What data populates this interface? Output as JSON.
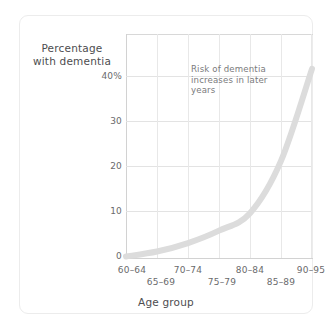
{
  "figure": {
    "background_color": "#ffffff",
    "card_border_color": "#ececec",
    "axis_color": "#d2d2d2",
    "grid_color": "#e5e5e5",
    "curve_color": "#dcdcdc",
    "text_color": "#58585a"
  },
  "chart_data": {
    "type": "line",
    "title": "",
    "xlabel": "Age group",
    "ylabel": "Percentage with dementia",
    "categories": [
      "60–64",
      "65–69",
      "70–74",
      "75–79",
      "80–84",
      "85–89",
      "90–95"
    ],
    "x": [
      0,
      1,
      2,
      3,
      4,
      5,
      6
    ],
    "values": [
      0.3,
      1.3,
      3.0,
      5.5,
      9.0,
      19.5,
      38.0
    ],
    "series": [
      {
        "name": "Percentage with dementia",
        "values": [
          0.3,
          1.3,
          3.0,
          5.5,
          9.0,
          19.5,
          38.0
        ]
      }
    ],
    "ylim": [
      0,
      45
    ],
    "xlim": [
      0,
      6
    ],
    "yticks": [
      0,
      10,
      20,
      30,
      40
    ],
    "ytick_labels": [
      "0",
      "10",
      "20",
      "30",
      "40%"
    ],
    "grid": true,
    "legend": "none",
    "annotations": [
      {
        "text": "Risk of dementia increases in later years",
        "lines": [
          "Risk of dementia",
          "increases in later",
          "years"
        ]
      }
    ]
  },
  "axes": {
    "y_title_lines": [
      "Percentage",
      "with dementia"
    ],
    "x_title": "Age group",
    "y_ticks": [
      {
        "label": "40%",
        "value": 40
      },
      {
        "label": "30",
        "value": 30
      },
      {
        "label": "20",
        "value": 20
      },
      {
        "label": "10",
        "value": 10
      },
      {
        "label": "0",
        "value": 0
      }
    ],
    "x_ticks_upper": [
      {
        "label": "60–64",
        "index": 0
      },
      {
        "label": "70–74",
        "index": 2
      },
      {
        "label": "80–84",
        "index": 4
      },
      {
        "label": "90–95",
        "index": 6
      }
    ],
    "x_ticks_lower": [
      {
        "label": "65–69",
        "index": 1
      },
      {
        "label": "75–79",
        "index": 3
      },
      {
        "label": "85–89",
        "index": 5
      }
    ]
  },
  "annotation": {
    "line1": "Risk of dementia",
    "line2": "increases in later",
    "line3": "years"
  }
}
